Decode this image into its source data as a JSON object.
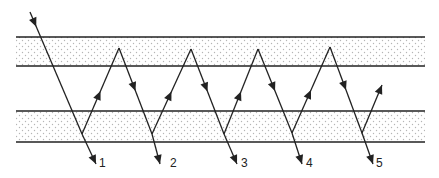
{
  "diagram": {
    "type": "multiple-reflection",
    "colors": {
      "line": "#222222",
      "dots": "#b5b5b5",
      "background": "#ffffff"
    },
    "layers": [
      {
        "name": "top-layer",
        "y_top": 37,
        "y_bottom": 66,
        "x_left": 16,
        "x_right": 425
      },
      {
        "name": "bottom-layer",
        "y_top": 111,
        "y_bottom": 142,
        "x_left": 16,
        "x_right": 425
      }
    ],
    "incident_ray": {
      "start": [
        30,
        12
      ],
      "end": [
        82,
        134
      ]
    },
    "bounce_path": [
      [
        82,
        134
      ],
      [
        119,
        48
      ],
      [
        152,
        134
      ],
      [
        191,
        49
      ],
      [
        224,
        134
      ],
      [
        258,
        49
      ],
      [
        292,
        133
      ],
      [
        330,
        47
      ],
      [
        362,
        133
      ],
      [
        382,
        85
      ]
    ],
    "exit_rays": [
      {
        "label": "1",
        "start": [
          82,
          134
        ],
        "end": [
          96,
          164
        ],
        "label_pos": [
          99,
          167
        ]
      },
      {
        "label": "2",
        "start": [
          152,
          134
        ],
        "end": [
          160,
          164
        ],
        "label_pos": [
          170,
          167
        ]
      },
      {
        "label": "3",
        "start": [
          224,
          134
        ],
        "end": [
          237,
          164
        ],
        "label_pos": [
          241,
          167
        ]
      },
      {
        "label": "4",
        "start": [
          292,
          133
        ],
        "end": [
          302,
          164
        ],
        "label_pos": [
          306,
          167
        ]
      },
      {
        "label": "5",
        "start": [
          362,
          133
        ],
        "end": [
          373,
          164
        ],
        "label_pos": [
          376,
          167
        ]
      }
    ]
  }
}
